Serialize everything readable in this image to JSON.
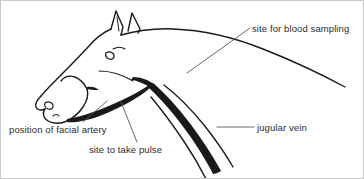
{
  "figure": {
    "background_color": "#ffffff",
    "ink_color": "#1a1a1a",
    "text_color": "#2b2b2b",
    "border_color": "#c9c9c9"
  },
  "labels": {
    "blood_sampling": "site for blood sampling",
    "jugular_vein": "jugular vein",
    "facial_artery": "position of facial artery",
    "take_pulse": "site to take pulse"
  },
  "annotations": [
    {
      "id": "blood-sampling",
      "text": "site for blood sampling",
      "text_position": "top-right",
      "leader": "diagonal line running down-left from text to the upper neck"
    },
    {
      "id": "jugular-vein",
      "text": "jugular vein",
      "text_position": "right",
      "leader": "short horizontal line running left from text to the thick dark jugular groove line"
    },
    {
      "id": "facial-artery",
      "text": "position of facial artery",
      "text_position": "bottom-left",
      "leader": "diagonal line running up-right from text to the lower jaw margin"
    },
    {
      "id": "take-pulse",
      "text": "site to take pulse",
      "text_position": "bottom-center",
      "leader": "diagonal line running up-left from text to the lower jaw margin"
    }
  ]
}
